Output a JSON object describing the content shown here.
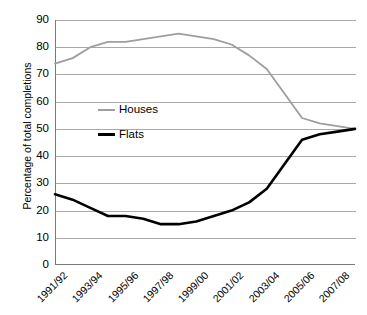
{
  "chart_data": {
    "type": "line",
    "title": "",
    "xlabel": "",
    "ylabel": "Percentage of total completions",
    "ylim": [
      0,
      90
    ],
    "yticks": [
      0,
      10,
      20,
      30,
      40,
      50,
      60,
      70,
      80,
      90
    ],
    "grid": true,
    "legend_position": "inside-left",
    "categories": [
      "1991/92",
      "1992/93",
      "1993/94",
      "1994/95",
      "1995/96",
      "1996/97",
      "1997/98",
      "1998/99",
      "1999/00",
      "2000/01",
      "2001/02",
      "2002/03",
      "2003/04",
      "2004/05",
      "2005/06",
      "2006/07",
      "2007/08",
      "2008/09"
    ],
    "xtick_labels": [
      "1991/92",
      "1993/94",
      "1995/96",
      "1997/98",
      "1999/00",
      "2001/02",
      "2003/04",
      "2005/06",
      "2007/08"
    ],
    "series": [
      {
        "name": "Houses",
        "color": "#9e9e9e",
        "values": [
          74,
          76,
          80,
          82,
          82,
          83,
          84,
          85,
          84,
          83,
          81,
          77,
          72,
          63,
          54,
          52,
          51,
          50
        ]
      },
      {
        "name": "Flats",
        "color": "#000000",
        "values": [
          26,
          24,
          21,
          18,
          18,
          17,
          15,
          15,
          16,
          18,
          20,
          23,
          28,
          37,
          46,
          48,
          49,
          50
        ]
      }
    ]
  },
  "legend": {
    "houses_label": "Houses",
    "flats_label": "Flats"
  },
  "axis": {
    "y_title": "Percentage of total completions"
  }
}
